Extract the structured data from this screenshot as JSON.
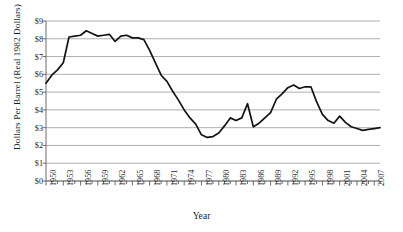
{
  "chart_data": {
    "type": "line",
    "title": "",
    "xlabel": "Year",
    "ylabel": "Dollars Per Barrel (Real 1982 Dollars)",
    "xlim": [
      1950,
      2008
    ],
    "ylim": [
      0,
      9
    ],
    "grid": true,
    "legend": "none",
    "y_tick_labels": [
      "$9",
      "$8",
      "$7",
      "$6",
      "$5",
      "$4",
      "$3",
      "$2",
      "$1",
      "$0"
    ],
    "y_tick_values": [
      9,
      8,
      7,
      6,
      5,
      4,
      3,
      2,
      1,
      0
    ],
    "x_tick_labels": [
      "1950",
      "1953",
      "1956",
      "1959",
      "1962",
      "1965",
      "1968",
      "1971",
      "1974",
      "1977",
      "1980",
      "1983",
      "1986",
      "1989",
      "1992",
      "1995",
      "1998",
      "2001",
      "2004",
      "2007"
    ],
    "x_tick_values": [
      1950,
      1953,
      1956,
      1959,
      1962,
      1965,
      1968,
      1971,
      1974,
      1977,
      1980,
      1983,
      1986,
      1989,
      1992,
      1995,
      1998,
      2001,
      2004,
      2007
    ],
    "x_minor_tick_step": 1,
    "series": [
      {
        "name": "Dollars Per Barrel (Real 1982 Dollars)",
        "color": "#141414",
        "x": [
          1950,
          1951,
          1952,
          1953,
          1954,
          1955,
          1956,
          1957,
          1958,
          1959,
          1960,
          1961,
          1962,
          1963,
          1964,
          1965,
          1966,
          1967,
          1968,
          1969,
          1970,
          1971,
          1972,
          1973,
          1974,
          1975,
          1976,
          1977,
          1978,
          1979,
          1980,
          1981,
          1982,
          1983,
          1984,
          1985,
          1986,
          1987,
          1988,
          1989,
          1990,
          1991,
          1992,
          1993,
          1994,
          1995,
          1996,
          1997,
          1998,
          1999,
          2000,
          2001,
          2002,
          2003,
          2004,
          2005,
          2006,
          2007,
          2008
        ],
        "values": [
          5.5,
          5.95,
          6.25,
          6.65,
          8.1,
          8.15,
          8.2,
          8.45,
          8.3,
          8.15,
          8.2,
          8.25,
          7.85,
          8.15,
          8.2,
          8.05,
          8.05,
          7.95,
          7.35,
          6.65,
          5.95,
          5.6,
          5.05,
          4.55,
          4.0,
          3.55,
          3.2,
          2.6,
          2.45,
          2.5,
          2.7,
          3.1,
          3.55,
          3.4,
          3.55,
          4.35,
          3.05,
          3.25,
          3.55,
          3.85,
          4.6,
          4.9,
          5.25,
          5.4,
          5.2,
          5.3,
          5.3,
          4.45,
          3.75,
          3.4,
          3.25,
          3.65,
          3.3,
          3.05,
          2.95,
          2.85,
          2.9,
          2.95,
          3.0
        ]
      }
    ]
  }
}
